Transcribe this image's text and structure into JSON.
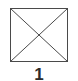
{
  "figure": {
    "label": "1",
    "background_color": "#ffffff",
    "stroke_color": "#4a4a4a",
    "label_color": "#2b2b2b",
    "stroke_width": 1,
    "square": {
      "x": 10.5,
      "y": 8.5,
      "width": 57,
      "height": 53
    },
    "diagonals": [
      {
        "x1": 10.5,
        "y1": 8.5,
        "x2": 67.5,
        "y2": 61.5
      },
      {
        "x1": 67.5,
        "y1": 8.5,
        "x2": 10.5,
        "y2": 61.5
      }
    ]
  }
}
